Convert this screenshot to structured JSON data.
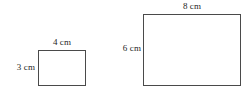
{
  "figure": {
    "kind": "geometry-diagram",
    "background_color": "#ffffff",
    "line_color": "#4a4a4a",
    "text_color": "#262626",
    "unit": "cm"
  },
  "shapes": [
    {
      "id": "small",
      "name": "small-rectangle",
      "width_label": "4 cm",
      "height_label": "3 cm",
      "width_value": 4,
      "height_value": 3
    },
    {
      "id": "large",
      "name": "large-rectangle",
      "width_label": "8 cm",
      "height_label": "6 cm",
      "width_value": 8,
      "height_value": 6
    }
  ]
}
